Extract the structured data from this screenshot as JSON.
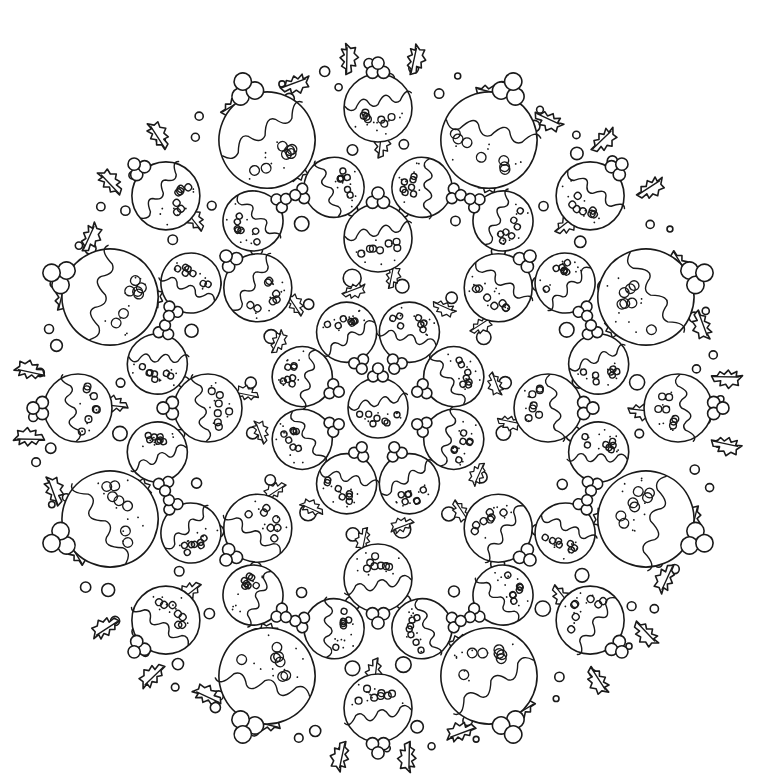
{
  "artwork": {
    "title": "",
    "kind": "coloring-page mandala",
    "subject": "Christmas puddings with holly leaves and berries",
    "center": [
      378,
      408
    ],
    "outer_radius": 345,
    "symmetry": 8,
    "colors": {
      "background": "#ffffff",
      "line": "#1a1a1a"
    },
    "center_pudding": {
      "r": 30,
      "rotation": 0
    },
    "pudding_rings": [
      {
        "name": "inner-ring",
        "count": 8,
        "radius": 82,
        "size": 30,
        "offset_deg": 22.5,
        "facing": "outward-reversed"
      },
      {
        "name": "second-ring",
        "count": 8,
        "radius": 170,
        "size": 34,
        "offset_deg": 0,
        "facing": "outward"
      },
      {
        "name": "third-ring",
        "count": 16,
        "radius": 225,
        "size": 30,
        "offset_deg": 11.25,
        "facing": "tangent"
      },
      {
        "name": "outer-large-ring",
        "count": 8,
        "radius": 290,
        "size": 48,
        "offset_deg": 22.5,
        "facing": "outward"
      },
      {
        "name": "outer-small-ring",
        "count": 8,
        "radius": 300,
        "size": 34,
        "offset_deg": 0,
        "facing": "outward"
      }
    ],
    "holly_rings": [
      {
        "count": 16,
        "radius": 120,
        "offset_deg": 5,
        "scale": 0.8
      },
      {
        "count": 16,
        "radius": 250,
        "offset_deg": 0,
        "scale": 0.9
      },
      {
        "count": 16,
        "radius": 335,
        "offset_deg": 5.5,
        "scale": 1.0
      },
      {
        "count": 16,
        "radius": 335,
        "offset_deg": -5.5,
        "scale": 1.0
      }
    ],
    "bubble_rings": [
      {
        "count": 16,
        "radius": 128,
        "offset_deg": 11.25,
        "size": 7
      },
      {
        "count": 24,
        "radius": 200,
        "offset_deg": 7.5,
        "size": 6
      },
      {
        "count": 32,
        "radius": 262,
        "offset_deg": 5.6,
        "size": 6
      },
      {
        "count": 40,
        "radius": 325,
        "offset_deg": 2,
        "size": 5
      },
      {
        "count": 48,
        "radius": 342,
        "offset_deg": 6,
        "size": 4
      }
    ]
  }
}
